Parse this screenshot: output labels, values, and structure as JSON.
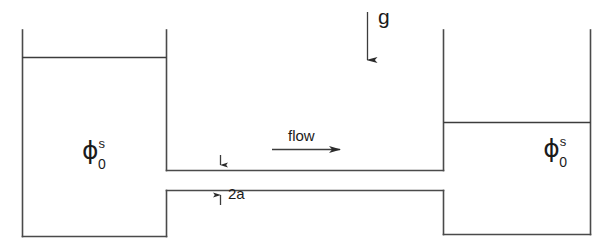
{
  "figure": {
    "background_color": "#ffffff",
    "line_color": "#4a4a4a",
    "text_color": "#1b1b1b"
  },
  "labels": {
    "gravity": "g",
    "flow": "flow",
    "channel_height": "2a",
    "potential_symbol": "ϕ",
    "potential_subscript": "0",
    "potential_superscript": "s"
  },
  "elements": {
    "gravity_arrow": {
      "name": "gravity-arrow",
      "direction": "down",
      "x": 367,
      "y_start": 12,
      "y_end": 66
    },
    "flow_arrow": {
      "name": "flow-arrow",
      "direction": "right",
      "y": 149,
      "x_start": 272,
      "x_end": 345
    },
    "channel": {
      "name": "channel",
      "top_y": 170,
      "bottom_y": 190,
      "x_start": 167,
      "x_end": 443
    },
    "left_reservoir": {
      "name": "left-reservoir",
      "left_x": 22,
      "right_x": 166,
      "top_y": 30,
      "bottom_y": 236,
      "fluid_level_y": 57
    },
    "right_reservoir": {
      "name": "right-reservoir",
      "left_x": 443,
      "right_x": 590,
      "top_y": 30,
      "bottom_y": 234,
      "fluid_level_y": 122
    },
    "dimension_marks": {
      "name": "channel-dimension",
      "x": 220,
      "upper_tick_top": 155,
      "upper_tick_bottom": 170,
      "lower_tick_top": 205,
      "lower_tick_bottom": 190
    }
  }
}
